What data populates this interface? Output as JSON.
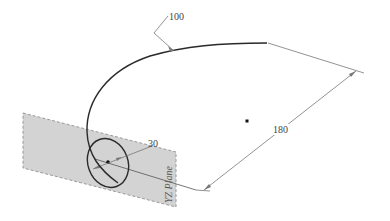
{
  "diagram": {
    "type": "cad-sketch",
    "colors": {
      "background": "#ffffff",
      "curve": "#2a2a2a",
      "dimension": "#777777",
      "plane_fill": "#d3d3d3",
      "plane_border": "#9a9a9a",
      "text": "#444444"
    },
    "labels": {
      "leader_dimension": "100",
      "length_dimension": "180",
      "circle_dimension": "30",
      "plane_name": "YZ Plane"
    }
  }
}
